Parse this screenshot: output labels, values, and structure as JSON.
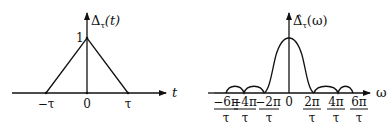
{
  "left_plot": {
    "y_label": "Δτ(t)",
    "y_label_main": "Δ",
    "y_label_sub": "τ",
    "y_label_arg": "(t)",
    "x_label": "t",
    "peak_label": "1",
    "ticks": [
      "−τ",
      "0",
      "τ"
    ]
  },
  "right_plot": {
    "y_label_main": "Δ̂",
    "y_label_sub": "τ",
    "y_label_arg": "(ω)",
    "x_label": "ω",
    "ticks": [
      {
        "num": "−6π",
        "den": "τ"
      },
      {
        "num": "−4π",
        "den": "τ"
      },
      {
        "num": "−2π",
        "den": "τ"
      },
      {
        "num": "0",
        "den": ""
      },
      {
        "num": "2π",
        "den": "τ"
      },
      {
        "num": "4π",
        "den": "τ"
      },
      {
        "num": "6π",
        "den": "τ"
      }
    ]
  }
}
